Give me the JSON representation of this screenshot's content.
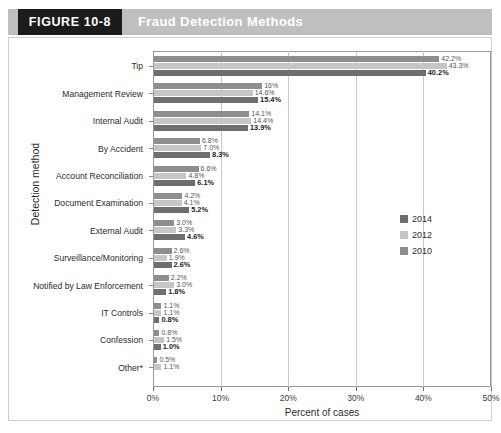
{
  "banner": {
    "figure_label": "FIGURE 10-8",
    "title": "Fraud Detection Methods",
    "banner_color": "#bfbfbf",
    "tab_color": "#1b1b1b"
  },
  "chart_data": {
    "type": "bar",
    "orientation": "horizontal",
    "title": "Fraud Detection Methods",
    "xlabel": "Percent of cases",
    "ylabel": "Detection method",
    "xlim": [
      0,
      50
    ],
    "xticks": [
      "0%",
      "10%",
      "20%",
      "30%",
      "40%",
      "50%"
    ],
    "xtick_values": [
      0,
      10,
      20,
      30,
      40,
      50
    ],
    "grid": true,
    "legend_position": "right",
    "categories": [
      "Tip",
      "Management Review",
      "Internal Audit",
      "By Accident",
      "Account Reconciliation",
      "Document Examination",
      "External Audit",
      "Surveillance/Monitoring",
      "Notified by Law Enforcement",
      "IT Controls",
      "Confession",
      "Other*"
    ],
    "series": [
      {
        "name": "2014",
        "color": "#8e8e8e",
        "values": [
          42.2,
          16.0,
          14.1,
          6.8,
          6.6,
          4.2,
          3.0,
          2.6,
          2.2,
          1.1,
          0.8,
          0.5
        ],
        "labels": [
          "42.2%",
          "16%",
          "14.1%",
          "6.8%",
          "6.6%",
          "4.2%",
          "3.0%",
          "2.6%",
          "2.2%",
          "1.1%",
          "0.8%",
          "0.5%"
        ]
      },
      {
        "name": "2012",
        "color": "#c6c6c6",
        "values": [
          43.3,
          14.6,
          14.4,
          7.0,
          4.8,
          4.1,
          3.3,
          1.9,
          3.0,
          1.1,
          1.5,
          1.1
        ],
        "labels": [
          "43.3%",
          "14.6%",
          "14.4%",
          "7.0%",
          "4.8%",
          "4.1%",
          "3.3%",
          "1.9%",
          "3.0%",
          "1.1%",
          "1.5%",
          "1.1%"
        ]
      },
      {
        "name": "2010",
        "color": "#6e6e6e",
        "values": [
          40.2,
          15.4,
          13.9,
          8.3,
          6.1,
          5.2,
          4.6,
          2.6,
          1.8,
          0.8,
          1.0,
          0.0
        ],
        "labels": [
          "40.2%",
          "15.4%",
          "13.9%",
          "8.3%",
          "6.1%",
          "5.2%",
          "4.6%",
          "2.6%",
          "1.8%",
          "0.8%",
          "1.0%",
          ""
        ]
      }
    ]
  },
  "legend": {
    "items": [
      {
        "label": "2014",
        "color": "#6e6e6e"
      },
      {
        "label": "2012",
        "color": "#c6c6c6"
      },
      {
        "label": "2010",
        "color": "#8e8e8e"
      }
    ]
  }
}
